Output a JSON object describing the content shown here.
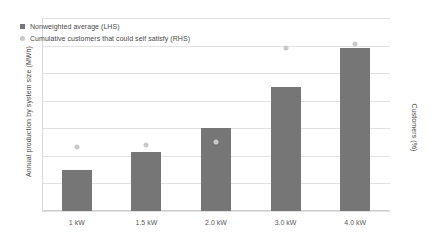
{
  "chart_data": {
    "type": "bar",
    "title": "",
    "subtitle": "",
    "xlabel": "",
    "ylabel": "Annual production by system size (MWh)",
    "y2label": "Customers (%)",
    "categories": [
      "1 kW",
      "1.5 kW",
      "2.0 kW",
      "3.0 kW",
      "4.0 kW"
    ],
    "ylim": [
      0,
      7
    ],
    "y2lim": [
      0,
      45
    ],
    "yticks": [
      0,
      1,
      2,
      3,
      4,
      5,
      6,
      7
    ],
    "y2ticks": [
      0,
      5,
      10,
      15,
      20,
      25,
      30,
      35,
      40,
      45
    ],
    "grid": true,
    "legend_position": "upper-left-inside",
    "series": [
      {
        "name": "Nonweighted average (LHS)",
        "type": "bar",
        "axis": "left",
        "color": "#767676",
        "values": [
          1.5,
          2.15,
          3.0,
          4.5,
          5.9
        ]
      },
      {
        "name": "Cumulative customers that could self satisfy (RHS)",
        "type": "scatter",
        "axis": "right",
        "color": "#c9c9c9",
        "values": [
          15.0,
          15.5,
          16.0,
          38.0,
          39.0
        ]
      }
    ]
  },
  "axes": {
    "left_title": "Annual production by system size (MWh)",
    "right_title": "Customers (%)",
    "left_ticks": [
      "0",
      "1",
      "2",
      "3",
      "4",
      "5",
      "6",
      "7"
    ],
    "right_ticks": [
      "0",
      "5",
      "10",
      "15",
      "20",
      "25",
      "30",
      "35",
      "40",
      "45"
    ],
    "x_ticks": [
      "1 kW",
      "1.5 kW",
      "2.0 kW",
      "3.0 kW",
      "4.0 kW"
    ]
  },
  "legend": {
    "items": [
      {
        "label": "Nonweighted average (LHS)",
        "marker": "square-marker",
        "color": "#767676"
      },
      {
        "label": "Cumulative customers that could self satisfy (RHS)",
        "marker": "circle-marker",
        "color": "#c9c9c9"
      }
    ]
  }
}
